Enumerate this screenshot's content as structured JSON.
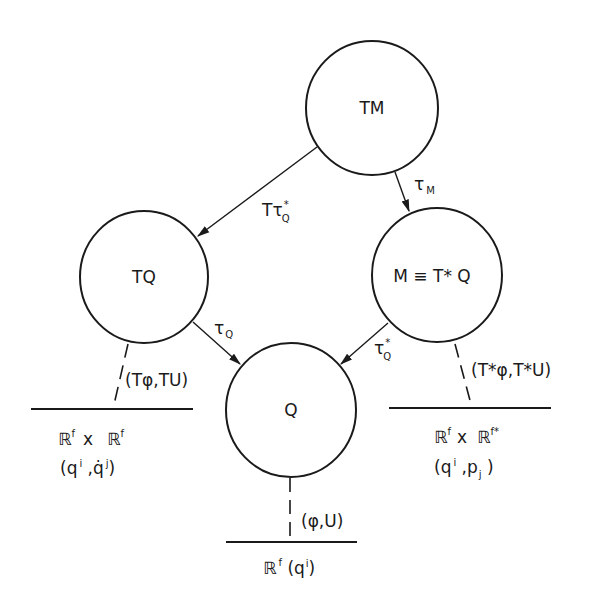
{
  "diagram": {
    "colors": {
      "ink": "#1a1a1a",
      "background": "#ffffff"
    },
    "nodes": [
      {
        "id": "TM",
        "label": "TM"
      },
      {
        "id": "TQ",
        "label": "TQ"
      },
      {
        "id": "M",
        "label": "M ≡ T* Q"
      },
      {
        "id": "Q",
        "label": "Q"
      }
    ],
    "edges": [
      {
        "from": "TM",
        "to": "TQ",
        "label_main": "Tτ",
        "label_sup": "*",
        "label_sub": "Q"
      },
      {
        "from": "TM",
        "to": "M",
        "label_main": "τ",
        "label_sub": "M"
      },
      {
        "from": "TQ",
        "to": "Q",
        "label_main": "τ",
        "label_sub": "Q"
      },
      {
        "from": "M",
        "to": "Q",
        "label_main": "τ",
        "label_sup": "*",
        "label_sub": "Q"
      }
    ],
    "charts": [
      {
        "from": "TQ",
        "map_label": "(Tφ,TU)",
        "space_a": "ℝ",
        "space_a_sup": "f",
        "space_x": "x",
        "space_b": "ℝ",
        "space_b_sup": "f",
        "coords_open": "(q",
        "coords_i": "i",
        "coords_mid": " ,q̇",
        "coords_j": "j",
        "coords_close": ")"
      },
      {
        "from": "M",
        "map_label": "(T*φ,T*U)",
        "space_a": "ℝ",
        "space_a_sup": "f",
        "space_x": "x",
        "space_b": "ℝ",
        "space_b_sup": "f*",
        "coords_open": "(q",
        "coords_i": "i",
        "coords_mid": " ,p",
        "coords_j": "j",
        "coords_close": " )"
      },
      {
        "from": "Q",
        "map_label": "(φ,U)",
        "space_a": "ℝ",
        "space_a_sup": "f",
        "coords_open": " (q",
        "coords_i": "i",
        "coords_close": ")"
      }
    ]
  }
}
